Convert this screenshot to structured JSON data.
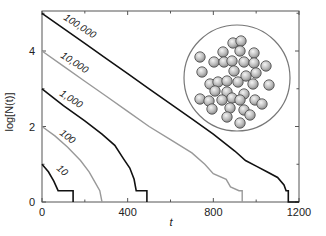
{
  "chart_data": {
    "type": "line",
    "title": "",
    "xlabel": "t",
    "ylabel": "log[N(t)]",
    "xlim": [
      0,
      1200
    ],
    "ylim": [
      0,
      5
    ],
    "x_ticks": [
      0,
      400,
      800,
      1200
    ],
    "y_ticks": [
      0,
      2,
      4
    ],
    "grid": false,
    "legend": "inline labels on curves",
    "series": [
      {
        "name": "100,000",
        "color": "#111111",
        "points": [
          [
            0,
            5.0
          ],
          [
            100,
            4.6
          ],
          [
            200,
            4.2
          ],
          [
            300,
            3.8
          ],
          [
            400,
            3.4
          ],
          [
            500,
            3.0
          ],
          [
            600,
            2.6
          ],
          [
            700,
            2.2
          ],
          [
            800,
            1.8
          ],
          [
            900,
            1.35
          ],
          [
            950,
            1.1
          ],
          [
            1000,
            0.95
          ],
          [
            1050,
            0.8
          ],
          [
            1100,
            0.65
          ],
          [
            1130,
            0.45
          ],
          [
            1140,
            0.3
          ],
          [
            1150,
            0.3
          ],
          [
            1150,
            0.0
          ],
          [
            1200,
            0.0
          ]
        ]
      },
      {
        "name": "10,000",
        "color": "#999999",
        "points": [
          [
            0,
            4.0
          ],
          [
            100,
            3.6
          ],
          [
            200,
            3.2
          ],
          [
            300,
            2.8
          ],
          [
            400,
            2.4
          ],
          [
            500,
            2.0
          ],
          [
            600,
            1.65
          ],
          [
            700,
            1.3
          ],
          [
            760,
            1.0
          ],
          [
            800,
            0.75
          ],
          [
            860,
            0.6
          ],
          [
            880,
            0.4
          ],
          [
            920,
            0.3
          ],
          [
            935,
            0.3
          ],
          [
            935,
            0.0
          ]
        ]
      },
      {
        "name": "1,000",
        "color": "#111111",
        "points": [
          [
            0,
            3.0
          ],
          [
            100,
            2.55
          ],
          [
            200,
            2.15
          ],
          [
            280,
            1.8
          ],
          [
            340,
            1.5
          ],
          [
            380,
            1.15
          ],
          [
            410,
            0.9
          ],
          [
            430,
            0.6
          ],
          [
            440,
            0.3
          ],
          [
            490,
            0.3
          ],
          [
            490,
            0.0
          ]
        ]
      },
      {
        "name": "100",
        "color": "#999999",
        "points": [
          [
            0,
            2.0
          ],
          [
            60,
            1.75
          ],
          [
            120,
            1.45
          ],
          [
            180,
            1.1
          ],
          [
            220,
            0.8
          ],
          [
            250,
            0.5
          ],
          [
            270,
            0.3
          ],
          [
            280,
            0.0
          ]
        ]
      },
      {
        "name": "10",
        "color": "#111111",
        "points": [
          [
            0,
            1.0
          ],
          [
            30,
            0.8
          ],
          [
            55,
            0.55
          ],
          [
            75,
            0.3
          ],
          [
            145,
            0.3
          ],
          [
            145,
            0.0
          ]
        ]
      }
    ],
    "annotations": [
      "100,000",
      "10,000",
      "1,000",
      "100",
      "10"
    ],
    "inset": {
      "description": "Circular container holding ~40 spherical particles",
      "particle_count_visible": 40
    }
  },
  "axes": {
    "xlabel": "t",
    "ylabel": "log[N(t)]",
    "x_ticks": [
      "0",
      "400",
      "800",
      "1200"
    ],
    "y_ticks": [
      "0",
      "2",
      "4"
    ]
  },
  "labels": {
    "c100000": "100,000",
    "c10000": "10,000",
    "c1000": "1,000",
    "c100": "100",
    "c10": "10"
  }
}
